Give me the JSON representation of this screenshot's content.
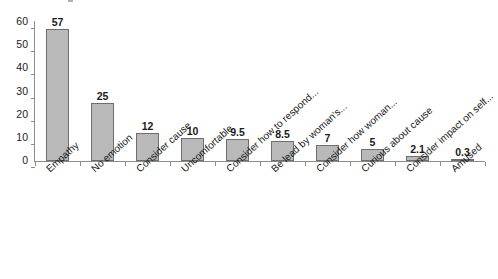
{
  "chart_data": {
    "type": "bar",
    "title": "",
    "subtitle": "",
    "xlabel": "",
    "ylabel": "",
    "ylim": [
      0,
      60
    ],
    "y_ticks": [
      0,
      10,
      20,
      30,
      40,
      50,
      60
    ],
    "grid": false,
    "legend": false,
    "legend_position": "none",
    "orientation": "vertical",
    "bar_fill_color": "#b9b9b9",
    "bar_border_color": "#6e6e6e",
    "axis_color": "#8c8c8c",
    "data_labels_shown": true,
    "categories": [
      "Empathy",
      "No emotion",
      "Consider cause",
      "Uncomfortable",
      "Consider how to respond...",
      "Be lead by woman's...",
      "Consider how woman...",
      "Curious about cause",
      "Consider impact on self...",
      "Amused"
    ],
    "values": [
      57,
      25,
      12,
      10,
      9.5,
      8.5,
      7,
      5,
      2.1,
      0.3
    ],
    "value_labels": [
      "57",
      "25",
      "12",
      "10",
      "9.5",
      "8.5",
      "7",
      "5",
      "2.1",
      "0.3"
    ],
    "series": [
      {
        "name": "",
        "values": [
          57,
          25,
          12,
          10,
          9.5,
          8.5,
          7,
          5,
          2.1,
          0.3
        ]
      }
    ]
  },
  "axis": {
    "y_tick_labels": [
      "60",
      "50",
      "40",
      "30",
      "20",
      "10",
      "0"
    ]
  }
}
